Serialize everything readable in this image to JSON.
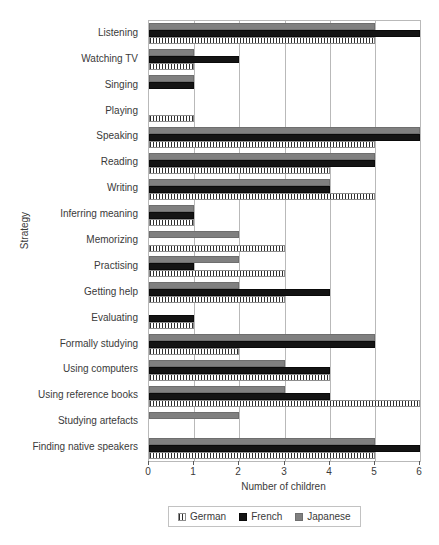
{
  "chart_data": {
    "type": "bar",
    "orientation": "horizontal",
    "title": "",
    "xlabel": "Number of children",
    "ylabel": "Strategy",
    "xlim": [
      0,
      6
    ],
    "xticks": [
      0,
      1,
      2,
      3,
      4,
      5,
      6
    ],
    "xtick_labels": [
      "0",
      "1",
      "2",
      "3",
      "4",
      "5",
      "6"
    ],
    "grid": true,
    "grid_axis": "x",
    "legend_position": "bottom",
    "categories": [
      "Listening",
      "Watching TV",
      "Singing",
      "Playing",
      "Speaking",
      "Reading",
      "Writing",
      "Inferring meaning",
      "Memorizing",
      "Practising",
      "Getting help",
      "Evaluating",
      "Formally studying",
      "Using computers",
      "Using reference books",
      "Studying artefacts",
      "Finding native speakers"
    ],
    "series": [
      {
        "name": "German",
        "key": "german",
        "color": "#ffffff",
        "pattern": "vertical-hatch",
        "values": [
          5,
          1,
          0,
          1,
          5,
          4,
          5,
          1,
          3,
          3,
          3,
          1,
          2,
          4,
          6,
          0,
          5
        ]
      },
      {
        "name": "French",
        "key": "french",
        "color": "#141414",
        "pattern": "solid",
        "values": [
          6,
          2,
          1,
          0,
          6,
          5,
          4,
          1,
          0,
          1,
          4,
          1,
          5,
          4,
          4,
          0,
          6
        ]
      },
      {
        "name": "Japanese",
        "key": "japanese",
        "color": "#808080",
        "pattern": "solid",
        "values": [
          5,
          1,
          1,
          0,
          6,
          5,
          4,
          1,
          2,
          2,
          2,
          0,
          5,
          3,
          3,
          2,
          5
        ]
      }
    ]
  },
  "legend": {
    "items": [
      {
        "label": "German",
        "key": "german"
      },
      {
        "label": "French",
        "key": "french"
      },
      {
        "label": "Japanese",
        "key": "japanese"
      }
    ]
  }
}
